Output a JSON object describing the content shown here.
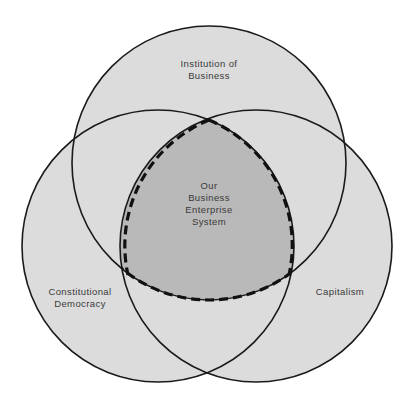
{
  "diagram": {
    "type": "venn",
    "colors": {
      "background": "#ffffff",
      "circle_fill": "#dcdcdc",
      "center_fill": "#b9b9b9",
      "stroke": "#1a1a1a"
    },
    "circles": [
      {
        "id": "institution",
        "label_lines": [
          "Institution of",
          "Business"
        ]
      },
      {
        "id": "democracy",
        "label_lines": [
          "Constitutional",
          "Democracy"
        ]
      },
      {
        "id": "capitalism",
        "label_lines": [
          "Capitalism"
        ]
      }
    ],
    "center": {
      "label_lines": [
        "Our",
        "Business",
        "Enterprise",
        "System"
      ],
      "border_style": "dashed"
    }
  }
}
